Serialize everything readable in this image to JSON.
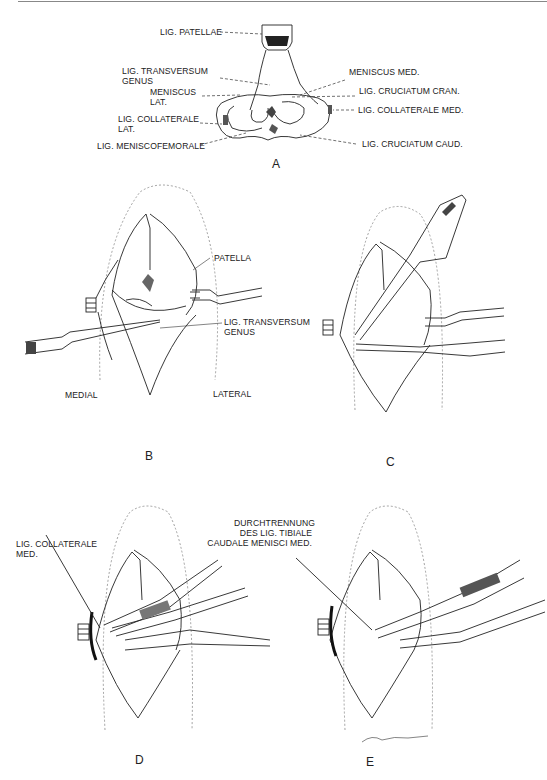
{
  "figure": {
    "panels": [
      {
        "id": "A",
        "label": "A",
        "description": "Tibial plateau, dorsal view with ligaments and menisci"
      },
      {
        "id": "B",
        "label": "B",
        "description": "Opened stifle joint with retractors"
      },
      {
        "id": "C",
        "label": "C",
        "description": "Scalpel incision"
      },
      {
        "id": "D",
        "label": "D",
        "description": "Clamp on medial collateral ligament"
      },
      {
        "id": "E",
        "label": "E",
        "description": "Transection of caudal tibial ligament of medial meniscus"
      }
    ]
  },
  "panel_a": {
    "labels": {
      "lig_patellae": "LIG. PATELLAE",
      "lig_transversum_1": "LIG. TRANSVERSUM",
      "lig_transversum_2": "GENUS",
      "meniscus_lat_1": "MENISCUS",
      "meniscus_lat_2": "LAT.",
      "lig_collaterale_lat_1": "LIG. COLLATERALE",
      "lig_collaterale_lat_2": "LAT.",
      "lig_meniscofemorale": "LIG. MENISCOFEMORALE",
      "meniscus_med": "MENISCUS MED.",
      "lig_cruciatum_cran": "LIG. CRUCIATUM CRAN.",
      "lig_collaterale_med": "LIG. COLLATERALE MED.",
      "lig_cruciatum_caud": "LIG. CRUCIATUM CAUD."
    }
  },
  "panel_b": {
    "labels": {
      "patella": "PATELLA",
      "lig_transversum_1": "LIG. TRANSVERSUM",
      "lig_transversum_2": "GENUS",
      "medial": "MEDIAL",
      "lateral": "LATERAL"
    }
  },
  "panel_d": {
    "labels": {
      "lig_collaterale_1": "LIG. COLLATERALE",
      "lig_collaterale_2": "MED."
    }
  },
  "panel_e": {
    "labels": {
      "line1": "DURCHTRENNUNG",
      "line2": "DES LIG. TIBIALE",
      "line3": "CAUDALE MENISCI MED."
    },
    "signature": "signature"
  }
}
